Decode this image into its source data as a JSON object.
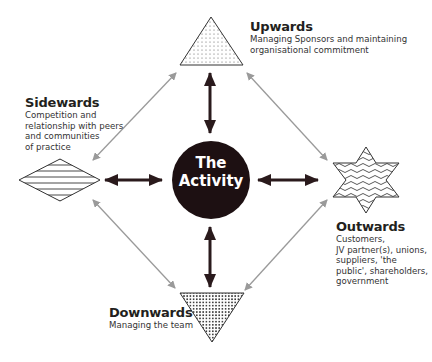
{
  "center": {
    "line1": "The",
    "line2": "Activity",
    "fill": "#1d1012"
  },
  "nodes": {
    "upwards": {
      "title": "Upwards",
      "lines": [
        "Managing Sponsors and maintaining",
        "organisational commitment"
      ]
    },
    "sidewards": {
      "title": "Sidewards",
      "lines": [
        "Competition and",
        "relationship with peers",
        "and communities",
        "of practice"
      ]
    },
    "outwards": {
      "title": "Outwards",
      "lines": [
        "Customers,",
        "JV partner(s), unions,",
        "suppliers, 'the",
        "public', shareholders,",
        "government"
      ]
    },
    "downwards": {
      "title": "Downwards",
      "lines": [
        "Managing the team"
      ]
    }
  },
  "colors": {
    "strong_arrow": "#2a1a1c",
    "weak_arrow": "#9a9a9a",
    "shape_stroke": "#333333"
  }
}
